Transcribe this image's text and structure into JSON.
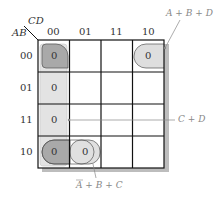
{
  "kmap": {
    "row_var": "AB",
    "col_var": "CD",
    "col_headers": [
      "00",
      "01",
      "11",
      "10"
    ],
    "row_headers": [
      "00",
      "01",
      "11",
      "10"
    ],
    "cells": [
      [
        "0",
        "",
        "",
        "0"
      ],
      [
        "0",
        "",
        "",
        ""
      ],
      [
        "0",
        "",
        "",
        ""
      ],
      [
        "0",
        "0",
        "",
        ""
      ]
    ]
  },
  "groups": [
    {
      "label": "A + B + D",
      "cells": [
        [
          0,
          0
        ],
        [
          0,
          3
        ]
      ],
      "fill": "#e0e0e0"
    },
    {
      "label": "C + D",
      "cells": [
        [
          0,
          0
        ],
        [
          1,
          0
        ],
        [
          2,
          0
        ],
        [
          3,
          0
        ]
      ],
      "fill": "#e6e6e6"
    },
    {
      "label": "A̅ + B + C",
      "cells": [
        [
          3,
          0
        ],
        [
          3,
          1
        ]
      ],
      "fill": "#e0e0e0"
    }
  ],
  "annotations": {
    "top_right": "A + B + D",
    "right": "C + D",
    "bottom": "A + B + C",
    "bottom_bar_letter": "A"
  },
  "colors": {
    "grid": "#111111",
    "shadow": "#bdbdbd",
    "overlap": "#a8a8a8",
    "group": "#dedede",
    "annotation": "#888888"
  }
}
